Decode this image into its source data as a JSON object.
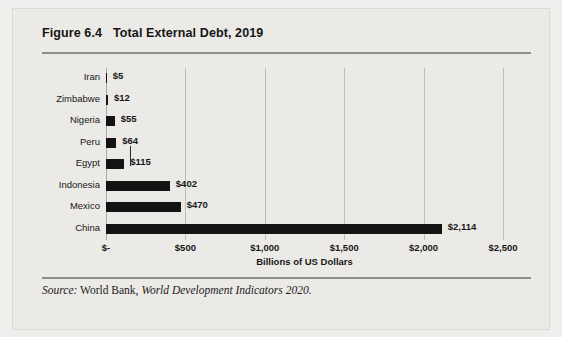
{
  "figure": {
    "number": "Figure 6.4",
    "title": "Total External Debt, 2019"
  },
  "source": {
    "label": "Source:",
    "publisher": "World Bank,",
    "work": "World Development Indicators 2020."
  },
  "chart_data": {
    "type": "bar",
    "orientation": "horizontal",
    "title": "Total External Debt, 2019",
    "xlabel": "Billions of US Dollars",
    "ylabel": "",
    "xlim": [
      0,
      2500
    ],
    "grid": "vertical",
    "legend": "none",
    "categories": [
      "Iran",
      "Zimbabwe",
      "Nigeria",
      "Peru",
      "Egypt",
      "Indonesia",
      "Mexico",
      "China"
    ],
    "values": [
      5,
      12,
      55,
      64,
      115,
      402,
      470,
      2114
    ],
    "data_labels": [
      "$5",
      "$12",
      "$55",
      "$64",
      "$115",
      "$402",
      "$470",
      "$2,114"
    ],
    "xticks": [
      0,
      500,
      1000,
      1500,
      2000,
      2500
    ],
    "xtick_labels": [
      "$-",
      "$500",
      "$1,000",
      "$1,500",
      "$2,000",
      "$2,500"
    ],
    "bar_color": "#131313",
    "grid_color": "#bcbcbc"
  }
}
